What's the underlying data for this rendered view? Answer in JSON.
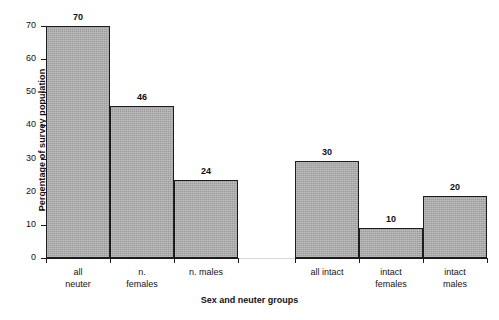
{
  "chart_data": {
    "type": "bar",
    "title": "",
    "xlabel": "Sex and neuter groups",
    "ylabel": "Percentage of survey population",
    "ylim": [
      0,
      70
    ],
    "yticks": [
      0,
      10,
      20,
      30,
      40,
      50,
      60,
      70
    ],
    "grid": false,
    "legend": null,
    "categories": [
      "all neuter",
      "n. females",
      "n. males",
      "all intact",
      "intact females",
      "intact males"
    ],
    "values": [
      70,
      46,
      24,
      30,
      10,
      20
    ],
    "bars": [
      {
        "category_line1": "all",
        "category_line2": "neuter",
        "label": "70",
        "value": 70,
        "drawn": 70.0,
        "group": "neuter"
      },
      {
        "category_line1": "n.",
        "category_line2": "females",
        "label": "46",
        "value": 46,
        "drawn": 45.8,
        "group": "neuter"
      },
      {
        "category_line1": "n. males",
        "category_line2": "",
        "label": "24",
        "value": 24,
        "drawn": 23.5,
        "group": "neuter"
      },
      {
        "category_line1": "all intact",
        "category_line2": "",
        "label": "30",
        "value": 30,
        "drawn": 29.3,
        "group": "intact"
      },
      {
        "category_line1": "intact",
        "category_line2": "females",
        "label": "10",
        "value": 10,
        "drawn": 9.2,
        "group": "intact"
      },
      {
        "category_line1": "intact",
        "category_line2": "males",
        "label": "20",
        "value": 20,
        "drawn": 18.7,
        "group": "intact"
      }
    ],
    "colors": {
      "bar_fill": "#a9a9a9",
      "bar_border": "#1d1d1d",
      "axis": "#1a1a1a",
      "text": "#121212",
      "background": "#ffffff"
    }
  }
}
